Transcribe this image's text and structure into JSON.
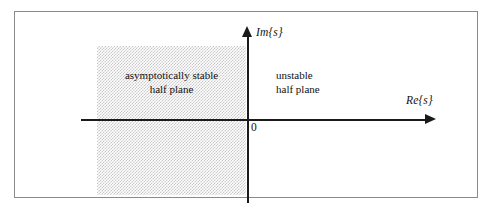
{
  "figure": {
    "axes": {
      "imaginary_axis_label": "Im{s}",
      "real_axis_label": "Re{s}",
      "origin_label": "0"
    },
    "regions": [
      {
        "id": "stable",
        "caption": "asymptotically stable\nhalf plane",
        "shaded": true,
        "shade_color": "#c9c9c9"
      },
      {
        "id": "unstable",
        "caption": "unstable\nhalf plane",
        "shaded": false,
        "shade_color": "#ffffff"
      }
    ],
    "colors": {
      "frame_border": "#8a8a8a",
      "axis": "#1a1a1a",
      "text": "#111111",
      "background": "#ffffff"
    }
  }
}
